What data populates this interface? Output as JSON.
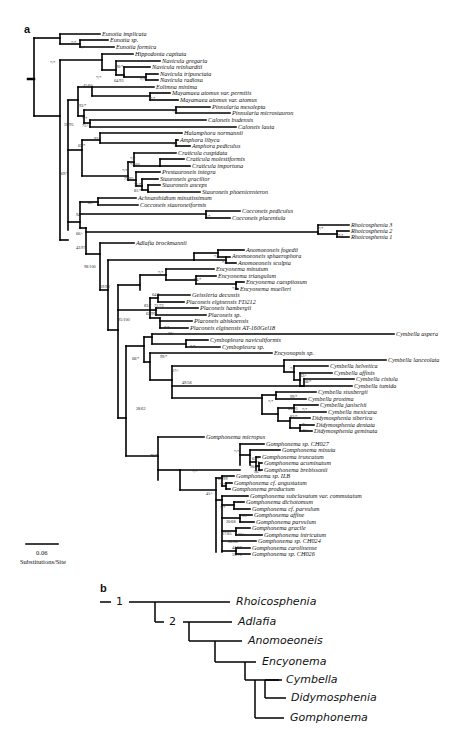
{
  "panel_a": {
    "label": "a",
    "scale_bar": {
      "value": "0.06",
      "unit": "Substitutions/Site"
    },
    "taxa": [
      {
        "name": "Eunotia implicata",
        "x": 102,
        "y": 34
      },
      {
        "name": "Eunotia sp.",
        "x": 110,
        "y": 40
      },
      {
        "name": "Eunotia formica",
        "x": 116,
        "y": 47
      },
      {
        "name": "Hippodonta capitata",
        "x": 135,
        "y": 54
      },
      {
        "name": "Navicula gregaria",
        "x": 162,
        "y": 61
      },
      {
        "name": "Navicula reinhardtii",
        "x": 152,
        "y": 67
      },
      {
        "name": "Navicula tripunctata",
        "x": 160,
        "y": 74
      },
      {
        "name": "Navicula radiosa",
        "x": 160,
        "y": 80
      },
      {
        "name": "Eolimna minima",
        "x": 156,
        "y": 87
      },
      {
        "name": "Mayamaea atomus var. permitis",
        "x": 172,
        "y": 93
      },
      {
        "name": "Mayamaea atomus var. atomus",
        "x": 180,
        "y": 100
      },
      {
        "name": "Pinnularia mesolepta",
        "x": 212,
        "y": 107
      },
      {
        "name": "Pinnularia microstauron",
        "x": 232,
        "y": 113
      },
      {
        "name": "Caloneis budensis",
        "x": 208,
        "y": 120
      },
      {
        "name": "Caloneis lauta",
        "x": 238,
        "y": 127
      },
      {
        "name": "Halamphora normannii",
        "x": 184,
        "y": 133
      },
      {
        "name": "Amphora libyca",
        "x": 180,
        "y": 140
      },
      {
        "name": "Amphora pediculus",
        "x": 192,
        "y": 146
      },
      {
        "name": "Craticula cuspidata",
        "x": 178,
        "y": 153
      },
      {
        "name": "Craticula molestiformis",
        "x": 186,
        "y": 159
      },
      {
        "name": "Craticula importuna",
        "x": 192,
        "y": 166
      },
      {
        "name": "Prestauroneis integra",
        "x": 162,
        "y": 172
      },
      {
        "name": "Stauroneis gracilior",
        "x": 160,
        "y": 179
      },
      {
        "name": "Stauroneis anceps",
        "x": 162,
        "y": 185
      },
      {
        "name": "Stauroneis phoenicenteron",
        "x": 202,
        "y": 192
      },
      {
        "name": "Achnanthidium minutissimum",
        "x": 138,
        "y": 198
      },
      {
        "name": "Cocconeis stauroneiformis",
        "x": 140,
        "y": 205
      },
      {
        "name": "Cocconeis pediculus",
        "x": 242,
        "y": 211
      },
      {
        "name": "Cocconeis placentula",
        "x": 232,
        "y": 218
      },
      {
        "name": "Rhoicosphenia 3",
        "x": 351,
        "y": 225
      },
      {
        "name": "Rhoicosphenia 2",
        "x": 351,
        "y": 231
      },
      {
        "name": "Rhoicosphenia 1",
        "x": 351,
        "y": 237
      },
      {
        "name": "Adlafia brockmannii",
        "x": 136,
        "y": 243
      },
      {
        "name": "Anomoeoneis fogedii",
        "x": 246,
        "y": 250
      },
      {
        "name": "Anomoeoneis sphaerophora",
        "x": 232,
        "y": 256
      },
      {
        "name": "Anomoeoneis sculpta",
        "x": 238,
        "y": 263
      },
      {
        "name": "Encyonema minutum",
        "x": 216,
        "y": 269
      },
      {
        "name": "Encyonema triangulum",
        "x": 218,
        "y": 276
      },
      {
        "name": "Encyonema caespitosum",
        "x": 246,
        "y": 282
      },
      {
        "name": "Encyonema muelleri",
        "x": 240,
        "y": 289
      },
      {
        "name": "Geissleria decussis",
        "x": 192,
        "y": 295
      },
      {
        "name": "Placoneis elginensis FD212",
        "x": 186,
        "y": 302
      },
      {
        "name": "Placoneis hambergii",
        "x": 200,
        "y": 308
      },
      {
        "name": "Placoneis sp.",
        "x": 208,
        "y": 315
      },
      {
        "name": "Placoneis abiskoensis",
        "x": 194,
        "y": 321
      },
      {
        "name": "Placoneis elginensis AT-160Gel18",
        "x": 190,
        "y": 328
      },
      {
        "name": "Cymbella aspera",
        "x": 396,
        "y": 334
      },
      {
        "name": "Cymbopleura naviculiformis",
        "x": 210,
        "y": 340
      },
      {
        "name": "Cymbopleura sp.",
        "x": 222,
        "y": 347
      },
      {
        "name": "Encyonopsis sp.",
        "x": 274,
        "y": 353
      },
      {
        "name": "Cymbella lanceolata",
        "x": 388,
        "y": 360
      },
      {
        "name": "Cymbella helvetica",
        "x": 330,
        "y": 366
      },
      {
        "name": "Cymbella affinis",
        "x": 334,
        "y": 373
      },
      {
        "name": "Cymbella cistula",
        "x": 356,
        "y": 379
      },
      {
        "name": "Cymbella tumida",
        "x": 354,
        "y": 386
      },
      {
        "name": "Cymbella stuxbergii",
        "x": 318,
        "y": 392
      },
      {
        "name": "Cymbella proxima",
        "x": 308,
        "y": 399
      },
      {
        "name": "Cymbella janischii",
        "x": 320,
        "y": 405
      },
      {
        "name": "Cymbella mexicana",
        "x": 328,
        "y": 412
      },
      {
        "name": "Didymosphenia siberica",
        "x": 312,
        "y": 418
      },
      {
        "name": "Didymosphenia dentata",
        "x": 316,
        "y": 425
      },
      {
        "name": "Didymosphenia geminata",
        "x": 314,
        "y": 431
      },
      {
        "name": "Gomphonema micropus",
        "x": 206,
        "y": 437
      },
      {
        "name": "Gomphonema sp. CH027",
        "x": 266,
        "y": 444
      },
      {
        "name": "Gomphonema minuta",
        "x": 282,
        "y": 450
      },
      {
        "name": "Gomphonema truncatum",
        "x": 262,
        "y": 457
      },
      {
        "name": "Gomphonema acuminatum",
        "x": 264,
        "y": 463
      },
      {
        "name": "Gomphonema brebissonii",
        "x": 264,
        "y": 470
      },
      {
        "name": "Gomphonema sp. ILB",
        "x": 236,
        "y": 476
      },
      {
        "name": "Gomphonema cf. angustatum",
        "x": 234,
        "y": 483
      },
      {
        "name": "Gomphonema productum",
        "x": 232,
        "y": 489
      },
      {
        "name": "Gomphonema subclavatum var. commutatum",
        "x": 250,
        "y": 496
      },
      {
        "name": "Gomphonema dichotomum",
        "x": 246,
        "y": 502
      },
      {
        "name": "Gomphonema cf. parvulum",
        "x": 252,
        "y": 509
      },
      {
        "name": "Gomphonema affine",
        "x": 254,
        "y": 515
      },
      {
        "name": "Gomphonema parvulum",
        "x": 256,
        "y": 522
      },
      {
        "name": "Gomphonema gracile",
        "x": 252,
        "y": 528
      },
      {
        "name": "Gomphonema intricatum",
        "x": 264,
        "y": 535
      },
      {
        "name": "Gomphonema sp. CH024",
        "x": 258,
        "y": 541
      },
      {
        "name": "Gomphonema carolinense",
        "x": 252,
        "y": 548
      },
      {
        "name": "Gomphonema sp. CH026",
        "x": 252,
        "y": 554
      }
    ],
    "support_values": [
      {
        "text": "*/*",
        "x": 50,
        "y": 63
      },
      {
        "text": "*/*",
        "x": 71,
        "y": 43
      },
      {
        "text": "*/*",
        "x": 96,
        "y": 78
      },
      {
        "text": "90/*",
        "x": 116,
        "y": 67
      },
      {
        "text": "64/93",
        "x": 114,
        "y": 81
      },
      {
        "text": "*/*",
        "x": 140,
        "y": 80
      },
      {
        "text": "*/*",
        "x": 80,
        "y": 48
      },
      {
        "text": "45/60",
        "x": 83,
        "y": 86
      },
      {
        "text": "*/*",
        "x": 150,
        "y": 99
      },
      {
        "text": "93/*",
        "x": 79,
        "y": 106
      },
      {
        "text": "*/*",
        "x": 172,
        "y": 112
      },
      {
        "text": "*/*",
        "x": 82,
        "y": 119
      },
      {
        "text": "71/-",
        "x": 82,
        "y": 126
      },
      {
        "text": "59/95",
        "x": 64,
        "y": 125
      },
      {
        "text": "93/*",
        "x": 94,
        "y": 139
      },
      {
        "text": "*/*",
        "x": 172,
        "y": 145
      },
      {
        "text": "*/*",
        "x": 130,
        "y": 159
      },
      {
        "text": "*/100",
        "x": 130,
        "y": 165
      },
      {
        "text": "65/*",
        "x": 78,
        "y": 146
      },
      {
        "text": "*/*",
        "x": 122,
        "y": 171
      },
      {
        "text": "75/95",
        "x": 124,
        "y": 179
      },
      {
        "text": "75/*",
        "x": 134,
        "y": 185
      },
      {
        "text": "81/*",
        "x": 134,
        "y": 191
      },
      {
        "text": "69/*",
        "x": 61,
        "y": 174
      },
      {
        "text": "82/*",
        "x": 88,
        "y": 203
      },
      {
        "text": "*/*",
        "x": 205,
        "y": 217
      },
      {
        "text": "94/*",
        "x": 76,
        "y": 215
      },
      {
        "text": "*/*",
        "x": 318,
        "y": 229
      },
      {
        "text": "*/*",
        "x": 338,
        "y": 236
      },
      {
        "text": "66/-",
        "x": 76,
        "y": 234
      },
      {
        "text": "43/97",
        "x": 76,
        "y": 248
      },
      {
        "text": "98/100",
        "x": 84,
        "y": 267
      },
      {
        "text": "*/*",
        "x": 214,
        "y": 257
      },
      {
        "text": "*/*",
        "x": 222,
        "y": 263
      },
      {
        "text": "*/*",
        "x": 158,
        "y": 273
      },
      {
        "text": "94/*",
        "x": 194,
        "y": 280
      },
      {
        "text": "*/*",
        "x": 232,
        "y": 289
      },
      {
        "text": "59/98",
        "x": 100,
        "y": 287
      },
      {
        "text": "64/*",
        "x": 152,
        "y": 295
      },
      {
        "text": "83/*",
        "x": 144,
        "y": 306
      },
      {
        "text": "71/72",
        "x": 154,
        "y": 306
      },
      {
        "text": "62/99",
        "x": 146,
        "y": 314
      },
      {
        "text": "*/*",
        "x": 164,
        "y": 328
      },
      {
        "text": "95/100",
        "x": 118,
        "y": 320
      },
      {
        "text": "28/-",
        "x": 168,
        "y": 334
      },
      {
        "text": "*/*",
        "x": 190,
        "y": 347
      },
      {
        "text": "99/*",
        "x": 160,
        "y": 357
      },
      {
        "text": "68/*",
        "x": 132,
        "y": 359
      },
      {
        "text": "17/-",
        "x": 172,
        "y": 371
      },
      {
        "text": "*/-",
        "x": 290,
        "y": 369
      },
      {
        "text": "33/-",
        "x": 300,
        "y": 376
      },
      {
        "text": "58/*",
        "x": 304,
        "y": 382
      },
      {
        "text": "49/58",
        "x": 182,
        "y": 383
      },
      {
        "text": "99/*",
        "x": 290,
        "y": 397
      },
      {
        "text": "*/*",
        "x": 268,
        "y": 402
      },
      {
        "text": "*/*",
        "x": 302,
        "y": 410
      },
      {
        "text": "63/95",
        "x": 288,
        "y": 409
      },
      {
        "text": "83/*",
        "x": 290,
        "y": 417
      },
      {
        "text": "*/-",
        "x": 302,
        "y": 425
      },
      {
        "text": "45/-",
        "x": 302,
        "y": 431
      },
      {
        "text": "28/62",
        "x": 136,
        "y": 409
      },
      {
        "text": "76/*",
        "x": 150,
        "y": 456
      },
      {
        "text": "*/*",
        "x": 234,
        "y": 452
      },
      {
        "text": "65/*",
        "x": 252,
        "y": 459
      },
      {
        "text": "*/*",
        "x": 254,
        "y": 463
      },
      {
        "text": "90/99",
        "x": 250,
        "y": 467
      },
      {
        "text": "96/*",
        "x": 254,
        "y": 472
      },
      {
        "text": "*/*",
        "x": 192,
        "y": 472
      },
      {
        "text": "67/99",
        "x": 218,
        "y": 479
      },
      {
        "text": "*/*",
        "x": 220,
        "y": 485
      },
      {
        "text": "41/-",
        "x": 206,
        "y": 494
      },
      {
        "text": "*/*",
        "x": 220,
        "y": 508
      },
      {
        "text": "*/*",
        "x": 236,
        "y": 510
      },
      {
        "text": "20/68",
        "x": 226,
        "y": 522
      },
      {
        "text": "99/*",
        "x": 242,
        "y": 516
      },
      {
        "text": "17/85",
        "x": 222,
        "y": 534
      },
      {
        "text": "33/-",
        "x": 238,
        "y": 535
      },
      {
        "text": "35/98",
        "x": 228,
        "y": 542
      },
      {
        "text": "44/87",
        "x": 232,
        "y": 548
      },
      {
        "text": "55/75",
        "x": 232,
        "y": 555
      }
    ]
  },
  "panel_b": {
    "label": "b",
    "node_labels": [
      "1",
      "2"
    ],
    "taxa": [
      "Rhoicosphenia",
      "Adlafia",
      "Anomoeoneis",
      "Encyonema",
      "Cymbella",
      "Didymosphenia",
      "Gomphonema"
    ]
  }
}
